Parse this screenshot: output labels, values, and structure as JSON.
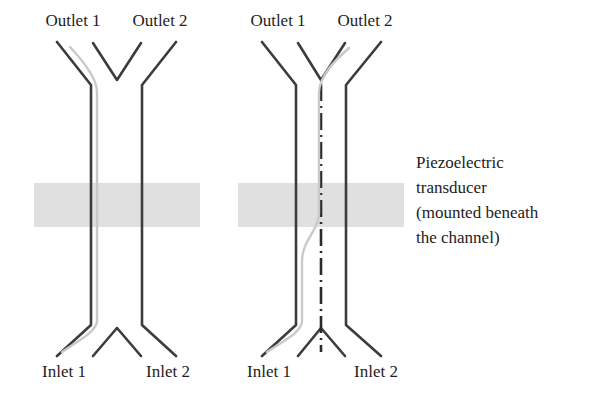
{
  "figure": {
    "colors": {
      "channel_wall": "#3c3c3c",
      "stream_line": "#c9c9c9",
      "transducer_band": "#e0e0e0",
      "nodal_line": "#2b2b2b",
      "background": "#ffffff",
      "text": "#1d1d1d"
    },
    "panels": [
      {
        "name": "transducer-off",
        "outlet_labels": [
          "Outlet 1",
          "Outlet 2"
        ],
        "inlet_labels": [
          "Inlet 1",
          "Inlet 2"
        ],
        "stream_path_description": "sample stream enters from Inlet 1 and remains along the left channel wall, exiting through Outlet 1",
        "nodal_line_visible": false,
        "transducer_band_visible": true
      },
      {
        "name": "transducer-on",
        "outlet_labels": [
          "Outlet 1",
          "Outlet 2"
        ],
        "inlet_labels": [
          "Inlet 1",
          "Inlet 2"
        ],
        "stream_path_description": "sample stream enters from Inlet 1, migrates to the central pressure node within the transducer region, and exits through Outlet 2",
        "nodal_line_visible": true,
        "transducer_band_visible": true
      }
    ],
    "annotation": {
      "lines": [
        "Piezoelectric",
        "transducer",
        "(mounted beneath",
        "the channel)"
      ]
    }
  }
}
